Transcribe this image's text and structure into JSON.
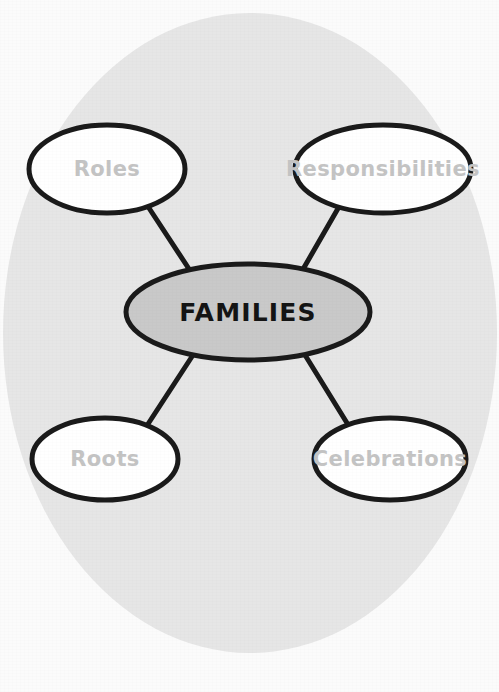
{
  "diagram": {
    "kind": "concept-map",
    "title": "FAMILIES",
    "background": {
      "paper_color": "#fbfbfb",
      "circle_color": "#e6e6e6"
    },
    "center_node": {
      "label": "FAMILIES",
      "fill": "#c9c9c9",
      "stroke": "#1a1a1a",
      "text_color": "#141414",
      "cx": 248,
      "cy": 312,
      "rx": 122,
      "ry": 48
    },
    "stroke_width": 5,
    "connector_color": "#1a1a1a",
    "satellite_defaults": {
      "fill": "#ffffff",
      "stroke": "#1a1a1a",
      "text_color": "#c4c4c4"
    },
    "nodes": [
      {
        "id": "roles",
        "label": "Roles",
        "cx": 107,
        "cy": 169,
        "rx": 78,
        "ry": 44,
        "font_size": 21
      },
      {
        "id": "responsibilities",
        "label": "Responsibilities",
        "cx": 383,
        "cy": 169,
        "rx": 88,
        "ry": 44,
        "font_size": 21
      },
      {
        "id": "roots",
        "label": "Roots",
        "cx": 105,
        "cy": 459,
        "rx": 73,
        "ry": 41,
        "font_size": 21
      },
      {
        "id": "celebrations",
        "label": "Celebrations",
        "cx": 390,
        "cy": 459,
        "rx": 76,
        "ry": 41,
        "font_size": 21
      }
    ],
    "connectors": [
      {
        "id": "roles-to-center",
        "from": "roles",
        "to": "center_node",
        "x1": 147,
        "y1": 205,
        "x2": 191,
        "y2": 272
      },
      {
        "id": "responsibilities-to-center",
        "from": "responsibilities",
        "to": "center_node",
        "x1": 340,
        "y1": 205,
        "x2": 302,
        "y2": 271
      },
      {
        "id": "roots-to-center",
        "from": "roots",
        "to": "center_node",
        "x1": 148,
        "y1": 424,
        "x2": 193,
        "y2": 355
      },
      {
        "id": "celebrations-to-center",
        "from": "celebrations",
        "to": "center_node",
        "x1": 347,
        "y1": 423,
        "x2": 305,
        "y2": 355
      }
    ],
    "background_circle": {
      "cx": 250,
      "cy": 333,
      "rx": 247,
      "ry": 320
    }
  }
}
